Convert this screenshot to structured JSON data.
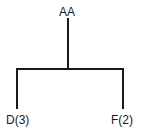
{
  "tree": {
    "root": {
      "label": "AA"
    },
    "children": [
      {
        "label": "D(3)"
      },
      {
        "label": "F(2)"
      }
    ]
  }
}
